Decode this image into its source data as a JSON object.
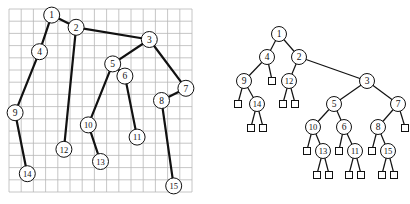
{
  "left_figure": {
    "description": "Binary tree drawn on a grid (rank-based layout)",
    "grid": {
      "x0": 9,
      "y0": 9,
      "cols": 15,
      "rows": 15,
      "cell": 12.2,
      "color": "#b8b8b8"
    },
    "nodes": [
      {
        "id": "1",
        "col": 3,
        "row": 0
      },
      {
        "id": "2",
        "col": 5,
        "row": 1
      },
      {
        "id": "3",
        "col": 11,
        "row": 2
      },
      {
        "id": "4",
        "col": 2,
        "row": 3
      },
      {
        "id": "5",
        "col": 8,
        "row": 4
      },
      {
        "id": "6",
        "col": 9,
        "row": 5
      },
      {
        "id": "7",
        "col": 14,
        "row": 6
      },
      {
        "id": "8",
        "col": 12,
        "row": 7
      },
      {
        "id": "9",
        "col": 0,
        "row": 8
      },
      {
        "id": "10",
        "col": 6,
        "row": 9
      },
      {
        "id": "11",
        "col": 10,
        "row": 10
      },
      {
        "id": "12",
        "col": 4,
        "row": 11
      },
      {
        "id": "13",
        "col": 7,
        "row": 12
      },
      {
        "id": "14",
        "col": 1,
        "row": 13
      },
      {
        "id": "15",
        "col": 13,
        "row": 14
      }
    ],
    "edges": [
      [
        "1",
        "4"
      ],
      [
        "1",
        "2"
      ],
      [
        "2",
        "12"
      ],
      [
        "2",
        "3"
      ],
      [
        "3",
        "5"
      ],
      [
        "3",
        "7"
      ],
      [
        "4",
        "9"
      ],
      [
        "9",
        "14"
      ],
      [
        "5",
        "10"
      ],
      [
        "5",
        "6"
      ],
      [
        "10",
        "13"
      ],
      [
        "6",
        "11"
      ],
      [
        "7",
        "8"
      ],
      [
        "8",
        "15"
      ]
    ]
  },
  "right_figure": {
    "description": "Same binary tree with external (leaf) nodes shown as squares",
    "nodes": [
      {
        "id": "1",
        "x": 279,
        "y": 34
      },
      {
        "id": "4",
        "x": 267,
        "y": 57
      },
      {
        "id": "2",
        "x": 299,
        "y": 57
      },
      {
        "id": "9",
        "x": 244,
        "y": 81
      },
      {
        "id": "12",
        "x": 289,
        "y": 81
      },
      {
        "id": "3",
        "x": 367,
        "y": 81
      },
      {
        "id": "14",
        "x": 257,
        "y": 104
      },
      {
        "id": "5",
        "x": 334,
        "y": 104
      },
      {
        "id": "7",
        "x": 398,
        "y": 104
      },
      {
        "id": "10",
        "x": 313,
        "y": 127
      },
      {
        "id": "6",
        "x": 344,
        "y": 127
      },
      {
        "id": "8",
        "x": 378,
        "y": 127
      },
      {
        "id": "13",
        "x": 323,
        "y": 151
      },
      {
        "id": "11",
        "x": 355,
        "y": 151
      },
      {
        "id": "15",
        "x": 388,
        "y": 151
      }
    ],
    "externals": [
      {
        "parent": "4",
        "x": 272,
        "y": 80
      },
      {
        "parent": "9",
        "x": 238,
        "y": 103
      },
      {
        "parent": "12",
        "x": 283,
        "y": 103
      },
      {
        "parent": "12",
        "x": 295,
        "y": 103
      },
      {
        "parent": "14",
        "x": 251,
        "y": 127
      },
      {
        "parent": "14",
        "x": 263,
        "y": 127
      },
      {
        "parent": "7",
        "x": 405,
        "y": 127
      },
      {
        "parent": "10",
        "x": 307,
        "y": 150
      },
      {
        "parent": "6",
        "x": 339,
        "y": 150
      },
      {
        "parent": "8",
        "x": 372,
        "y": 150
      },
      {
        "parent": "13",
        "x": 317,
        "y": 174
      },
      {
        "parent": "13",
        "x": 329,
        "y": 174
      },
      {
        "parent": "11",
        "x": 349,
        "y": 174
      },
      {
        "parent": "11",
        "x": 361,
        "y": 174
      },
      {
        "parent": "15",
        "x": 382,
        "y": 174
      },
      {
        "parent": "15",
        "x": 394,
        "y": 174
      }
    ],
    "edges": [
      [
        "1",
        "4"
      ],
      [
        "1",
        "2"
      ],
      [
        "4",
        "9"
      ],
      [
        "2",
        "12"
      ],
      [
        "2",
        "3"
      ],
      [
        "9",
        "14"
      ],
      [
        "3",
        "5"
      ],
      [
        "3",
        "7"
      ],
      [
        "5",
        "10"
      ],
      [
        "5",
        "6"
      ],
      [
        "7",
        "8"
      ],
      [
        "10",
        "13"
      ],
      [
        "6",
        "11"
      ],
      [
        "8",
        "15"
      ]
    ]
  },
  "style": {
    "node_radius": 7.5,
    "square_size": 7,
    "edge_color": "#111111",
    "left_edge_width": 2.2,
    "right_edge_width": 1.2,
    "node_fill": "#ffffff",
    "node_stroke": "#111111"
  }
}
